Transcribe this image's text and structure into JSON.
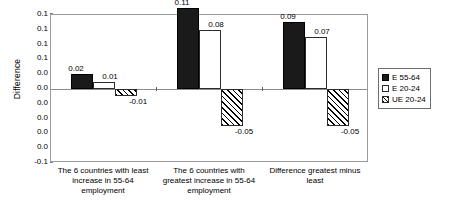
{
  "chart_data": {
    "type": "bar",
    "title": "",
    "subtitle": "",
    "xlabel": "",
    "ylabel": "Difference",
    "ylim": [
      -0.1,
      0.1
    ],
    "ytick_step": 0.02,
    "ytick_labels": [
      "0.1",
      "0.1",
      "0.1",
      "0.1",
      "0.0",
      "0.0",
      "0.0",
      "0.0",
      "0.0",
      "0.0",
      "-0.1"
    ],
    "ytick_values": [
      0.1,
      0.08,
      0.06,
      0.04,
      0.02,
      0.0,
      -0.02,
      -0.04,
      -0.06,
      -0.08,
      -0.1
    ],
    "grid": false,
    "zero_line": true,
    "legend_position": "right",
    "categories": [
      "The 6 countries with least increase in 55-64 employment",
      "The 6 countries with greatest increase in  55-64 employment",
      "Difference greatest minus least"
    ],
    "series": [
      {
        "name": "E 55-64",
        "fill": "black",
        "values": [
          0.02,
          0.11,
          0.09
        ],
        "labels": [
          "0.02",
          "0.11",
          "0.09"
        ]
      },
      {
        "name": "E 20-24",
        "fill": "white",
        "values": [
          0.01,
          0.08,
          0.07
        ],
        "labels": [
          "0.01",
          "0.08",
          "0.07"
        ]
      },
      {
        "name": "UE 20-24",
        "fill": "hatch",
        "values": [
          -0.01,
          -0.05,
          -0.05
        ],
        "labels": [
          "-0.01",
          "-0.05",
          "-0.05"
        ]
      }
    ]
  },
  "legend": {
    "items": [
      {
        "label": "E 55-64",
        "fill": "black"
      },
      {
        "label": "E 20-24",
        "fill": "white"
      },
      {
        "label": "UE 20-24",
        "fill": "hatch"
      }
    ]
  },
  "colors": {
    "series_black": "#1a1a1a",
    "series_white": "#ffffff",
    "series_hatch_line": "#000000",
    "axis": "#9a9a9a",
    "zero_line": "#8c8c8c",
    "text": "#000000"
  }
}
